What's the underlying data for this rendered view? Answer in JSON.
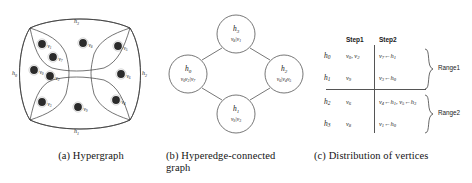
{
  "figure": {
    "panels": [
      {
        "id": "a",
        "caption": "(a) Hypergraph",
        "vertices": [
          {
            "id": "v1",
            "base": "v",
            "sub": "1",
            "x": 34,
            "y": 30
          },
          {
            "id": "v7",
            "base": "v",
            "sub": "7",
            "x": 45,
            "y": 43
          },
          {
            "id": "v0",
            "base": "v",
            "sub": "0",
            "x": 26,
            "y": 56
          },
          {
            "id": "v2",
            "base": "v",
            "sub": "2",
            "x": 42,
            "y": 62
          },
          {
            "id": "v8",
            "base": "v",
            "sub": "8",
            "x": 75,
            "y": 29
          },
          {
            "id": "v5",
            "base": "v",
            "sub": "5",
            "x": 110,
            "y": 32
          },
          {
            "id": "v6",
            "base": "v",
            "sub": "6",
            "x": 113,
            "y": 60
          },
          {
            "id": "v3",
            "base": "v",
            "sub": "3",
            "x": 34,
            "y": 88
          },
          {
            "id": "v9",
            "base": "v",
            "sub": "9",
            "x": 70,
            "y": 93
          },
          {
            "id": "v4",
            "base": "v",
            "sub": "4",
            "x": 108,
            "y": 86
          }
        ],
        "hyperedges": [
          {
            "id": "h0",
            "base": "h",
            "sub": "0",
            "label_x": 4,
            "label_y": 58
          },
          {
            "id": "h1",
            "base": "h",
            "sub": "1",
            "label_x": 68,
            "label_y": 118
          },
          {
            "id": "h2",
            "base": "h",
            "sub": "2",
            "label_x": 134,
            "label_y": 58
          },
          {
            "id": "h3",
            "base": "h",
            "sub": "3",
            "label_x": 68,
            "label_y": 8
          }
        ]
      },
      {
        "id": "b",
        "caption": "(b) Hyperedge-connected graph",
        "nodes": [
          {
            "id": "h3",
            "base": "h",
            "sub": "3",
            "contents": "v8|v1",
            "cx": 70,
            "cy": 24,
            "r": 19
          },
          {
            "id": "h0",
            "base": "h",
            "sub": "0",
            "contents": "v0v2|v7",
            "cx": 22,
            "cy": 64,
            "r": 19
          },
          {
            "id": "h2",
            "base": "h",
            "sub": "2",
            "contents": "v6|v4v5",
            "cx": 118,
            "cy": 64,
            "r": 19
          },
          {
            "id": "h1",
            "base": "h",
            "sub": "1",
            "contents": "v9|v3",
            "cx": 70,
            "cy": 104,
            "r": 19
          }
        ],
        "edges": [
          {
            "from": "h3",
            "to": "h0"
          },
          {
            "from": "h3",
            "to": "h2"
          },
          {
            "from": "h0",
            "to": "h1"
          },
          {
            "from": "h2",
            "to": "h1"
          }
        ]
      },
      {
        "id": "c",
        "caption": "(c) Distribution of vertices",
        "columns": [
          "Step1",
          "Step2"
        ],
        "rows": [
          {
            "label": "h0",
            "label_base": "h",
            "label_sub": "0",
            "step1": "v0, v2",
            "step2": "v7←h1",
            "range": "Range1"
          },
          {
            "label": "h1",
            "label_base": "h",
            "label_sub": "1",
            "step1": "v9",
            "step2": "v3←h0",
            "range": "Range1"
          },
          {
            "label": "h2",
            "label_base": "h",
            "label_sub": "2",
            "step1": "v6",
            "step2": "v4←h1, v5←h3",
            "range": "Range2"
          },
          {
            "label": "h3",
            "label_base": "h",
            "label_sub": "3",
            "step1": "v8",
            "step2": "v1←h0",
            "range": "Range2"
          }
        ],
        "ranges": [
          "Range1",
          "Range2"
        ]
      }
    ]
  },
  "colors": {
    "ink": "#1c1c1c",
    "stroke": "#3a3a3a",
    "vertex_fill": "#2b2b2b",
    "background": "#ffffff"
  }
}
